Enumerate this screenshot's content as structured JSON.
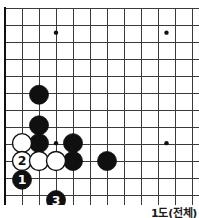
{
  "caption": {
    "text": "1도(전체)"
  },
  "board": {
    "title": "go-diagram",
    "line_color": "#3a3a3a",
    "border_color": "#111111",
    "black_color": "#101010",
    "white_color": "#ffffff",
    "background": "#ffffff",
    "origin_x": 5,
    "origin_y": 8,
    "spacing": 17,
    "cols": 12,
    "rows": 12,
    "stone_radius": 9.5,
    "border_width": 2.2,
    "line_width": 1.0,
    "star_radius": 2.2
  },
  "star_points": [
    {
      "name": "star-point-upper-left",
      "col": 3,
      "row": 1.45
    },
    {
      "name": "star-point-upper-right",
      "col": 9.5,
      "row": 1.45
    },
    {
      "name": "star-point-center-left",
      "col": 3,
      "row": 7.95
    },
    {
      "name": "star-point-center-right",
      "col": 9.5,
      "row": 7.95
    }
  ],
  "stones": [
    {
      "name": "black-stone-a",
      "color": "black",
      "col": 2,
      "row": 5.1,
      "label": ""
    },
    {
      "name": "black-stone-b",
      "color": "black",
      "col": 2,
      "row": 6.9,
      "label": ""
    },
    {
      "name": "black-stone-c",
      "color": "black",
      "col": 2,
      "row": 7.95,
      "label": ""
    },
    {
      "name": "white-stone-a",
      "color": "white",
      "col": 1,
      "row": 7.95,
      "label": ""
    },
    {
      "name": "black-stone-d",
      "color": "black",
      "col": 4,
      "row": 7.95,
      "label": ""
    },
    {
      "name": "black-stone-e",
      "color": "black",
      "col": 4,
      "row": 9.0,
      "label": ""
    },
    {
      "name": "black-stone-f",
      "color": "black",
      "col": 6,
      "row": 9.0,
      "label": ""
    },
    {
      "name": "white-stone-move-2",
      "color": "white",
      "col": 1,
      "row": 9.0,
      "label": "2"
    },
    {
      "name": "white-stone-b",
      "color": "white",
      "col": 2,
      "row": 9.0,
      "label": ""
    },
    {
      "name": "white-stone-c",
      "color": "white",
      "col": 3,
      "row": 9.0,
      "label": ""
    },
    {
      "name": "black-stone-move-1",
      "color": "black",
      "col": 1,
      "row": 10.1,
      "label": "1"
    },
    {
      "name": "black-stone-move-3",
      "color": "black",
      "col": 3,
      "row": 11.3,
      "label": "3"
    }
  ]
}
